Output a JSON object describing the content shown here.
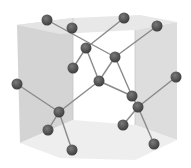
{
  "diagram": {
    "colors": {
      "background": "#ffffff",
      "left_face": "#cfcfcf",
      "top_face": "#e6e6e6",
      "right_face": "#d9d9d9",
      "bottom_face": "#ececec",
      "front_face": "#e0e0e0",
      "bond": "#8a8a8a",
      "atom": "#4a4a4a",
      "atom_highlight": "#7a7a7a"
    },
    "atom_radius": 5.5,
    "atoms": [
      {
        "id": "a1",
        "x": 47,
        "y": 20
      },
      {
        "id": "a2",
        "x": 72,
        "y": 28
      },
      {
        "id": "a3",
        "x": 124,
        "y": 18
      },
      {
        "id": "a4",
        "x": 157,
        "y": 26
      },
      {
        "id": "a5",
        "x": 86,
        "y": 48
      },
      {
        "id": "a6",
        "x": 115,
        "y": 57
      },
      {
        "id": "a7",
        "x": 73,
        "y": 68
      },
      {
        "id": "a8",
        "x": 99,
        "y": 81
      },
      {
        "id": "a9",
        "x": 17,
        "y": 84
      },
      {
        "id": "a10",
        "x": 176,
        "y": 77
      },
      {
        "id": "a11",
        "x": 132,
        "y": 96
      },
      {
        "id": "a12",
        "x": 138,
        "y": 107
      },
      {
        "id": "a13",
        "x": 59,
        "y": 112
      },
      {
        "id": "a14",
        "x": 48,
        "y": 130
      },
      {
        "id": "a15",
        "x": 123,
        "y": 125
      },
      {
        "id": "a16",
        "x": 72,
        "y": 150
      },
      {
        "id": "a17",
        "x": 154,
        "y": 144
      }
    ],
    "bonds": [
      [
        "a1",
        "a6"
      ],
      [
        "a3",
        "a5"
      ],
      [
        "a5",
        "a7"
      ],
      [
        "a5",
        "a8"
      ],
      [
        "a4",
        "a6"
      ],
      [
        "a6",
        "a8"
      ],
      [
        "a6",
        "a11"
      ],
      [
        "a8",
        "a13"
      ],
      [
        "a8",
        "a11"
      ],
      [
        "a9",
        "a13"
      ],
      [
        "a13",
        "a14"
      ],
      [
        "a13",
        "a16"
      ],
      [
        "a10",
        "a12"
      ],
      [
        "a11",
        "a12"
      ],
      [
        "a12",
        "a15"
      ],
      [
        "a12",
        "a17"
      ]
    ],
    "faces": [
      {
        "name": "left-face",
        "points": "17,25 73,18 73,120 20,143",
        "color_key": "left_face"
      },
      {
        "name": "top-face",
        "points": "17,25 73,18 140,15 177,22 135,30 60,34",
        "color_key": "top_face"
      },
      {
        "name": "right-face",
        "points": "135,30 177,22 177,140 135,125",
        "color_key": "right_face"
      },
      {
        "name": "bottom-face",
        "points": "20,143 73,120 135,125 177,140 135,160 60,158",
        "color_key": "bottom_face"
      }
    ]
  }
}
